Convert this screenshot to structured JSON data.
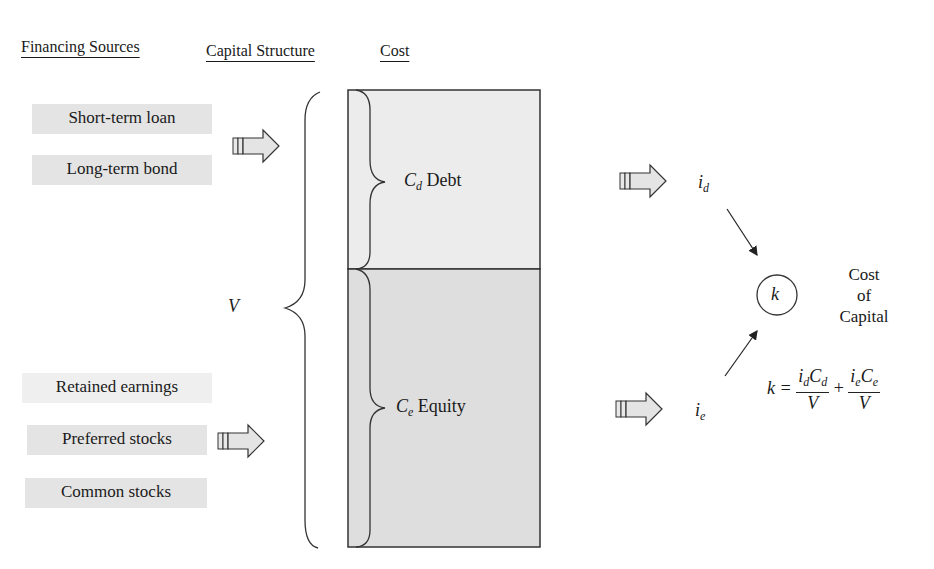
{
  "headings": {
    "financing_sources": "Financing Sources",
    "capital_structure": "Capital Structure",
    "cost": "Cost"
  },
  "financing_sources": {
    "debt_group": [
      "Short-term loan",
      "Long-term bond"
    ],
    "equity_group": [
      "Retained earnings",
      "Preferred stocks",
      "Common stocks"
    ]
  },
  "capital_structure": {
    "total_label": "V",
    "debt": {
      "symbol": "C",
      "subscript": "d",
      "label": "Debt"
    },
    "equity": {
      "symbol": "C",
      "subscript": "e",
      "label": "Equity"
    }
  },
  "cost": {
    "debt_rate": {
      "symbol": "i",
      "subscript": "d"
    },
    "equity_rate": {
      "symbol": "i",
      "subscript": "e"
    },
    "node": "k",
    "node_caption": [
      "Cost",
      "of",
      "Capital"
    ],
    "formula": {
      "lhs": "k =",
      "term1_num_a": "i",
      "term1_num_a_sub": "d",
      "term1_num_b": "C",
      "term1_num_b_sub": "d",
      "term1_den": "V",
      "plus": "+",
      "term2_num_a": "i",
      "term2_num_a_sub": "e",
      "term2_num_b": "C",
      "term2_num_b_sub": "e",
      "term2_den": "V"
    }
  },
  "colors": {
    "debt_fill": "#ececec",
    "equity_fill": "#dedede",
    "source_box": "#e4e4e4",
    "line": "#2a2a2a"
  }
}
